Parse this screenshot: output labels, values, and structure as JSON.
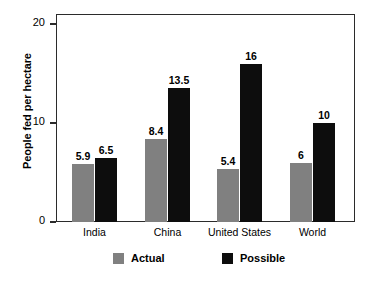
{
  "chart_data": {
    "type": "bar",
    "title": "",
    "xlabel": "",
    "ylabel": "People fed per hectare",
    "categories": [
      "India",
      "China",
      "United States",
      "World"
    ],
    "series": [
      {
        "name": "Actual",
        "color": "#808080",
        "values": [
          5.9,
          8.4,
          5.4,
          6
        ]
      },
      {
        "name": "Possible",
        "color": "#0d0d0d",
        "values": [
          6.5,
          13.5,
          16,
          10
        ]
      }
    ],
    "value_labels": {
      "Actual": [
        "5.9",
        "8.4",
        "5.4",
        "6"
      ],
      "Possible": [
        "6.5",
        "13.5",
        "16",
        "10"
      ]
    },
    "ylim": [
      0,
      21
    ],
    "yticks": [
      0,
      10,
      20
    ],
    "ytick_labels": [
      "0",
      "10",
      "20"
    ],
    "grid": false,
    "legend_position": "bottom"
  },
  "axis": {
    "y_title": "People fed per hectare",
    "ticks": [
      {
        "value": 20,
        "label": "20"
      },
      {
        "value": 10,
        "label": "10"
      },
      {
        "value": 0,
        "label": "0"
      }
    ]
  },
  "legend": {
    "items": [
      {
        "label": "Actual",
        "color": "#808080"
      },
      {
        "label": "Possible",
        "color": "#0d0d0d"
      }
    ]
  }
}
